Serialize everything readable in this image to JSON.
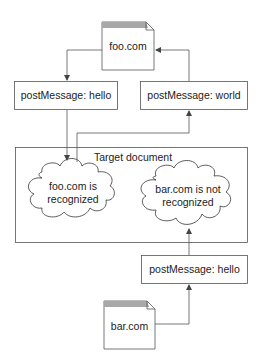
{
  "diagram": {
    "documents": {
      "foo": {
        "label": "foo.com"
      },
      "bar": {
        "label": "bar.com"
      }
    },
    "messages": {
      "foo_hello": {
        "label": "postMessage: hello"
      },
      "foo_world": {
        "label": "postMessage: world"
      },
      "bar_hello": {
        "label": "postMessage: hello"
      }
    },
    "target": {
      "title": "Target document",
      "cloud_left": {
        "line1": "foo.com is",
        "line2": "recognized"
      },
      "cloud_right": {
        "line1": "bar.com is not",
        "line2": "recognized"
      }
    },
    "colors": {
      "stroke": "#555555",
      "doc_band": "#a8a8a8",
      "background": "#ffffff"
    }
  }
}
